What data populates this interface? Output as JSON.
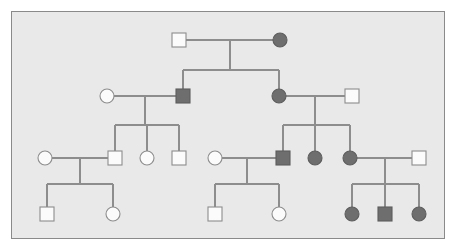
{
  "figure": {
    "type": "pedigree-diagram",
    "background_color": "#e9e9e9",
    "page_color": "#ffffff",
    "border_color": "#8a8a8a",
    "line_color": "#8d8d8d",
    "affected_fill_color": "#6e6e6e",
    "unaffected_fill_color": "#fbfbfb",
    "frame": {
      "x": 11,
      "y": 11,
      "width": 434,
      "height": 228
    },
    "symbol_size": 14,
    "legend_note": "square = male, circle = female, filled = affected, open = unaffected"
  },
  "chart_data": {
    "type": "pedigree",
    "generations": 4,
    "individuals": [
      {
        "id": "I-1",
        "generation": 1,
        "sex": "male",
        "shape": "square",
        "affected": false,
        "cx": 179,
        "cy": 40
      },
      {
        "id": "I-2",
        "generation": 1,
        "sex": "female",
        "shape": "circle",
        "affected": true,
        "cx": 280,
        "cy": 40
      },
      {
        "id": "II-1",
        "generation": 2,
        "sex": "female",
        "shape": "circle",
        "affected": false,
        "cx": 107,
        "cy": 96
      },
      {
        "id": "II-2",
        "generation": 2,
        "sex": "male",
        "shape": "square",
        "affected": true,
        "cx": 183,
        "cy": 96
      },
      {
        "id": "II-3",
        "generation": 2,
        "sex": "female",
        "shape": "circle",
        "affected": true,
        "cx": 279,
        "cy": 96
      },
      {
        "id": "II-4",
        "generation": 2,
        "sex": "male",
        "shape": "square",
        "affected": false,
        "cx": 352,
        "cy": 96
      },
      {
        "id": "III-1",
        "generation": 3,
        "sex": "female",
        "shape": "circle",
        "affected": false,
        "cx": 45,
        "cy": 158
      },
      {
        "id": "III-2",
        "generation": 3,
        "sex": "male",
        "shape": "square",
        "affected": false,
        "cx": 115,
        "cy": 158
      },
      {
        "id": "III-3",
        "generation": 3,
        "sex": "female",
        "shape": "circle",
        "affected": false,
        "cx": 147,
        "cy": 158
      },
      {
        "id": "III-4",
        "generation": 3,
        "sex": "male",
        "shape": "square",
        "affected": false,
        "cx": 179,
        "cy": 158
      },
      {
        "id": "III-5",
        "generation": 3,
        "sex": "female",
        "shape": "circle",
        "affected": false,
        "cx": 215,
        "cy": 158
      },
      {
        "id": "III-6",
        "generation": 3,
        "sex": "male",
        "shape": "square",
        "affected": true,
        "cx": 283,
        "cy": 158
      },
      {
        "id": "III-7",
        "generation": 3,
        "sex": "female",
        "shape": "circle",
        "affected": true,
        "cx": 315,
        "cy": 158
      },
      {
        "id": "III-8",
        "generation": 3,
        "sex": "female",
        "shape": "circle",
        "affected": true,
        "cx": 350,
        "cy": 158
      },
      {
        "id": "III-9",
        "generation": 3,
        "sex": "male",
        "shape": "square",
        "affected": false,
        "cx": 419,
        "cy": 158
      },
      {
        "id": "IV-1",
        "generation": 4,
        "sex": "male",
        "shape": "square",
        "affected": false,
        "cx": 47,
        "cy": 214
      },
      {
        "id": "IV-2",
        "generation": 4,
        "sex": "female",
        "shape": "circle",
        "affected": false,
        "cx": 113,
        "cy": 214
      },
      {
        "id": "IV-3",
        "generation": 4,
        "sex": "male",
        "shape": "square",
        "affected": false,
        "cx": 215,
        "cy": 214
      },
      {
        "id": "IV-4",
        "generation": 4,
        "sex": "female",
        "shape": "circle",
        "affected": false,
        "cx": 279,
        "cy": 214
      },
      {
        "id": "IV-5",
        "generation": 4,
        "sex": "female",
        "shape": "circle",
        "affected": true,
        "cx": 352,
        "cy": 214
      },
      {
        "id": "IV-6",
        "generation": 4,
        "sex": "male",
        "shape": "square",
        "affected": true,
        "cx": 385,
        "cy": 214
      },
      {
        "id": "IV-7",
        "generation": 4,
        "sex": "female",
        "shape": "circle",
        "affected": true,
        "cx": 419,
        "cy": 214
      }
    ],
    "matings": [
      {
        "id": "M1",
        "partners": [
          "I-1",
          "I-2"
        ],
        "line_y": 40,
        "x1": 186,
        "x2": 273,
        "drop_x": 230,
        "sib_y": 70,
        "children": [
          "II-2",
          "II-3"
        ]
      },
      {
        "id": "M2",
        "partners": [
          "II-1",
          "II-2"
        ],
        "line_y": 96,
        "x1": 114,
        "x2": 176,
        "drop_x": 145,
        "sib_y": 125,
        "children": [
          "III-2",
          "III-3",
          "III-4"
        ]
      },
      {
        "id": "M3",
        "partners": [
          "II-3",
          "II-4"
        ],
        "line_y": 96,
        "x1": 286,
        "x2": 345,
        "drop_x": 315,
        "sib_y": 125,
        "children": [
          "III-6",
          "III-7",
          "III-8"
        ]
      },
      {
        "id": "M4",
        "partners": [
          "III-1",
          "III-2"
        ],
        "line_y": 158,
        "x1": 52,
        "x2": 108,
        "drop_x": 80,
        "sib_y": 184,
        "children": [
          "IV-1",
          "IV-2"
        ]
      },
      {
        "id": "M5",
        "partners": [
          "III-5",
          "III-6"
        ],
        "line_y": 158,
        "x1": 222,
        "x2": 276,
        "drop_x": 247,
        "sib_y": 184,
        "children": [
          "IV-3",
          "IV-4"
        ]
      },
      {
        "id": "M6",
        "partners": [
          "III-8",
          "III-9"
        ],
        "line_y": 158,
        "x1": 357,
        "x2": 412,
        "drop_x": 385,
        "sib_y": 184,
        "children": [
          "IV-5",
          "IV-6",
          "IV-7"
        ]
      }
    ],
    "counts": {
      "total_individuals": 22,
      "affected": 9,
      "unaffected": 13,
      "males": 10,
      "females": 12,
      "matings": 6
    }
  }
}
